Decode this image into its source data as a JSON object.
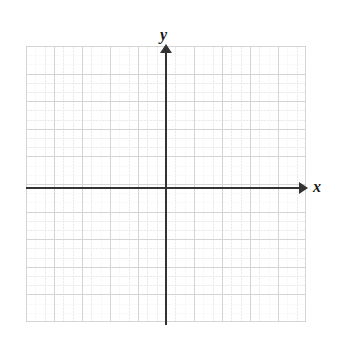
{
  "figure": {
    "kind": "blank-cartesian-coordinate-plane",
    "background_color": "#ffffff"
  },
  "axes": {
    "x": {
      "label": "x",
      "arrow_direction": "right",
      "line_color": "#333333"
    },
    "y": {
      "label": "y",
      "arrow_direction": "up",
      "line_color": "#333333"
    }
  },
  "grid": {
    "major_color": "#cfcfcf",
    "minor_color": "#dcdcdc",
    "major_cells_x": 10,
    "major_cells_y": 10,
    "minor_per_major": 3,
    "style": "dotted"
  },
  "chart_data": {
    "type": "scatter",
    "title": "",
    "subtitle": "",
    "xlabel": "x",
    "ylabel": "y",
    "x": [],
    "values": [],
    "series": [],
    "categories": [],
    "tick_labels_x": [],
    "tick_labels_y": [],
    "legend_entries": [],
    "annotations": [],
    "xlim": [
      -5,
      5
    ],
    "ylim": [
      -5,
      5
    ],
    "grid": true,
    "legend_position": "none",
    "note": "Empty coordinate plane: no plotted data points, no numeric tick labels rendered."
  }
}
